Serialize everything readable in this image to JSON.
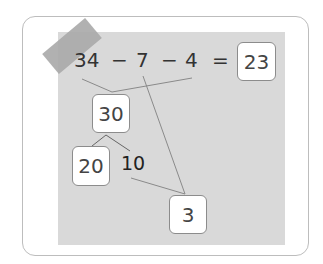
{
  "equation": {
    "term1": "34",
    "op1": "−",
    "term2": "7",
    "op2": "−",
    "term3": "4",
    "equals": "=",
    "answer": "23"
  },
  "decomposition": {
    "sum_box": "30",
    "split_box": "20",
    "split_text": "10",
    "remainder_box": "3"
  },
  "colors": {
    "paper": "#d9d9d9",
    "tape": "#a8a8a8",
    "line": "#8a8a8a",
    "box_border": "#8c8c8c"
  }
}
